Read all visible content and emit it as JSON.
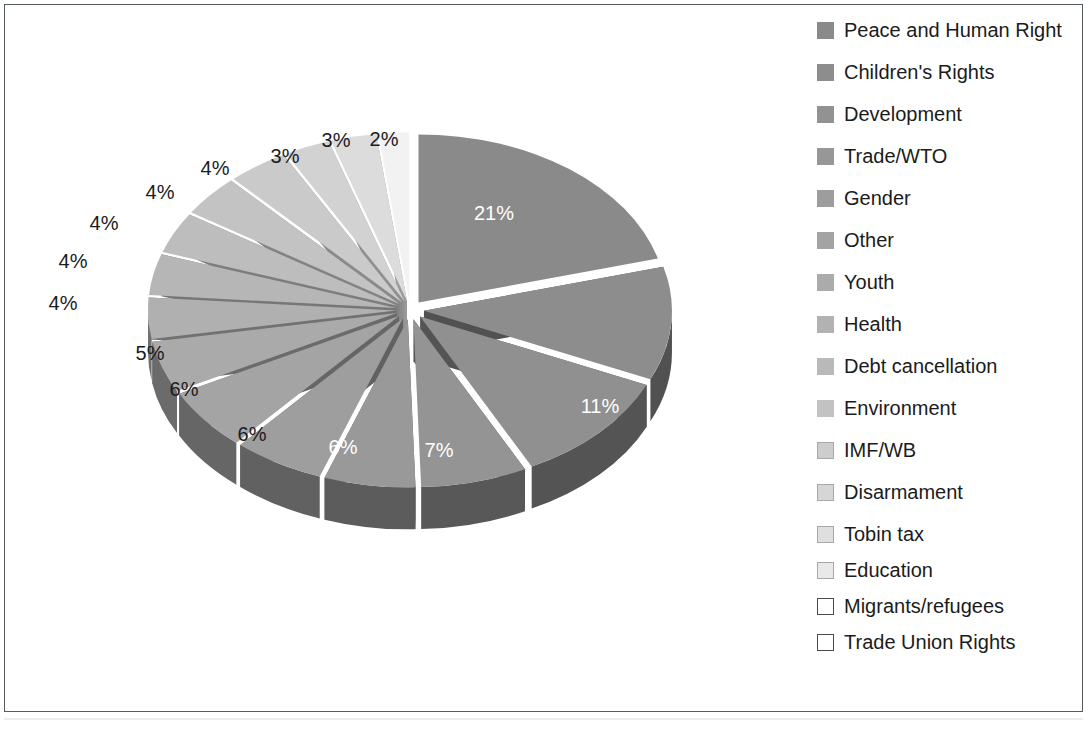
{
  "chart_data": {
    "type": "pie",
    "title": "",
    "subtitle": "",
    "xlabel": "",
    "ylabel": "",
    "grid": false,
    "legend_position": "right",
    "three_d": true,
    "exploded": true,
    "value_suffix": "%",
    "categories": [
      "Peace and Human Right",
      "Children's Rights",
      "Development",
      "Trade/WTO",
      "Gender",
      "Other",
      "Youth",
      "Health",
      "Debt cancellation",
      "Environment",
      "IMF/WB",
      "Disarmament",
      "Tobin tax",
      "Education",
      "Migrants/refugees",
      "Trade Union Rights"
    ],
    "values": [
      21,
      11,
      11,
      7,
      6,
      6,
      6,
      5,
      4,
      4,
      4,
      4,
      4,
      3,
      3,
      2
    ],
    "labels": [
      "21%",
      "11%",
      "11%",
      "7%",
      "6%",
      "6%",
      "6%",
      "5%",
      "4%",
      "4%",
      "4%",
      "4%",
      "4%",
      "3%",
      "3%",
      "2%"
    ],
    "slice_colors": [
      "#8a8a8a",
      "#8d8d8d",
      "#909090",
      "#949494",
      "#999999",
      "#9e9e9e",
      "#a4a4a4",
      "#aaaaaa",
      "#b0b0b0",
      "#b6b6b6",
      "#bdbdbd",
      "#c3c3c3",
      "#cacaca",
      "#d2d2d2",
      "#dcdcdc",
      "#f2f2f2"
    ],
    "side_colors": [
      "#4e4e4e",
      "#515151",
      "#545454",
      "#585858",
      "#5c5c5c",
      "#616161",
      "#666666",
      "#6b6b6b",
      "#717171",
      "#777777",
      "#7d7d7d",
      "#838383",
      "#8a8a8a",
      "#909090",
      "#9a9a9a",
      "#b0b0b0"
    ],
    "label_colors": [
      "#ffffff",
      "#ffffff",
      "#ffffff",
      "#ffffff",
      "#ffffff",
      "#1b1b1b",
      "#1b1b1b",
      "#1b1b1b",
      "#1b1b1b",
      "#1b1b1b",
      "#1b1b1b",
      "#1b1b1b",
      "#1b1b1b",
      "#1b1b1b",
      "#1b1b1b",
      "#1b1b1b"
    ]
  },
  "labels": {
    "items": [
      {
        "text": "21%",
        "x": 484,
        "y": 203,
        "inside": true
      },
      {
        "text": "11%",
        "x": 702,
        "y": 312,
        "inside": true
      },
      {
        "text": "11%",
        "x": 590,
        "y": 396,
        "inside": true
      },
      {
        "text": "7%",
        "x": 429,
        "y": 440,
        "inside": true
      },
      {
        "text": "6%",
        "x": 333,
        "y": 437,
        "inside": true
      },
      {
        "text": "6%",
        "x": 242,
        "y": 424,
        "inside": false
      },
      {
        "text": "6%",
        "x": 174,
        "y": 379,
        "inside": false
      },
      {
        "text": "5%",
        "x": 140,
        "y": 343,
        "inside": false
      },
      {
        "text": "4%",
        "x": 53,
        "y": 293,
        "inside": false
      },
      {
        "text": "4%",
        "x": 63,
        "y": 251,
        "inside": false
      },
      {
        "text": "4%",
        "x": 94,
        "y": 213,
        "inside": false
      },
      {
        "text": "4%",
        "x": 150,
        "y": 182,
        "inside": false
      },
      {
        "text": "4%",
        "x": 205,
        "y": 158,
        "inside": false
      },
      {
        "text": "3%",
        "x": 275,
        "y": 146,
        "inside": false
      },
      {
        "text": "3%",
        "x": 326,
        "y": 130,
        "inside": false
      },
      {
        "text": "2%",
        "x": 374,
        "y": 129,
        "inside": false
      }
    ]
  },
  "legend": {
    "items": [
      {
        "label": "Peace and Human Right",
        "swatch": "#8a8a8a",
        "swatch_border": "#8a8a8a"
      },
      {
        "label": "Children's Rights",
        "swatch": "#8d8d8d",
        "swatch_border": "#8d8d8d"
      },
      {
        "label": "Development",
        "swatch": "#929292",
        "swatch_border": "#929292"
      },
      {
        "label": "Trade/WTO",
        "swatch": "#979797",
        "swatch_border": "#979797"
      },
      {
        "label": "Gender",
        "swatch": "#9d9d9d",
        "swatch_border": "#9d9d9d"
      },
      {
        "label": "Other",
        "swatch": "#a3a3a3",
        "swatch_border": "#a3a3a3"
      },
      {
        "label": "Youth",
        "swatch": "#ababab",
        "swatch_border": "#ababab"
      },
      {
        "label": "Health",
        "swatch": "#b2b2b2",
        "swatch_border": "#b2b2b2"
      },
      {
        "label": "Debt cancellation",
        "swatch": "#b9b9b9",
        "swatch_border": "#b9b9b9"
      },
      {
        "label": "Environment",
        "swatch": "#c2c2c2",
        "swatch_border": "#c2c2c2"
      },
      {
        "label": "IMF/WB",
        "swatch": "#cdcdcd",
        "swatch_border": "#a8a8a8"
      },
      {
        "label": "Disarmament",
        "swatch": "#d6d6d6",
        "swatch_border": "#a8a8a8"
      },
      {
        "label": "Tobin tax",
        "swatch": "#dfdfdf",
        "swatch_border": "#a8a8a8"
      },
      {
        "label": "Education",
        "swatch": "#e9e9e9",
        "swatch_border": "#a8a8a8"
      },
      {
        "label": "Migrants/refugees",
        "swatch": "#ffffff",
        "swatch_border": "#4a4a4a"
      },
      {
        "label": "Trade Union Rights",
        "swatch": "#ffffff",
        "swatch_border": "#4a4a4a"
      }
    ]
  },
  "geometry": {
    "cx": 400,
    "cy": 300,
    "rx": 248,
    "ry": 168,
    "depth": 42,
    "explode": 14,
    "start_angle": -90
  }
}
